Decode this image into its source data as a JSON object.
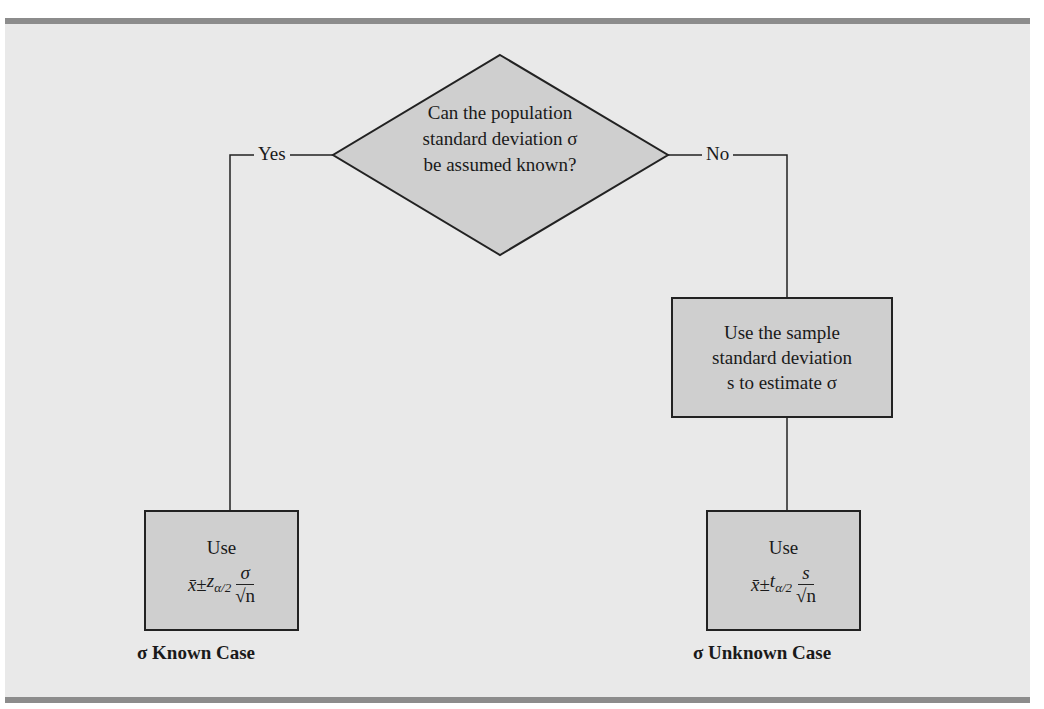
{
  "decision": {
    "lines": [
      "Can the population",
      "standard deviation σ",
      "be assumed known?"
    ],
    "yes_label": "Yes",
    "no_label": "No"
  },
  "estimate_box": {
    "lines": [
      "Use the sample",
      "standard deviation",
      "s to estimate σ"
    ]
  },
  "known_box": {
    "use": "Use",
    "xbar": "x̄",
    "pm": "±",
    "crit": "z",
    "crit_sub": "α/2",
    "numerator": "σ",
    "denominator": "√n",
    "caption": "σ Known Case"
  },
  "unknown_box": {
    "use": "Use",
    "xbar": "x̄",
    "pm": "±",
    "crit": "t",
    "crit_sub": "α/2",
    "numerator": "s",
    "denominator": "√n",
    "caption": "σ Unknown Case"
  },
  "colors": {
    "panel": "#e9e9e9",
    "box_fill": "#cfcfcf",
    "bar": "#8c8c8c",
    "stroke": "#222222"
  }
}
